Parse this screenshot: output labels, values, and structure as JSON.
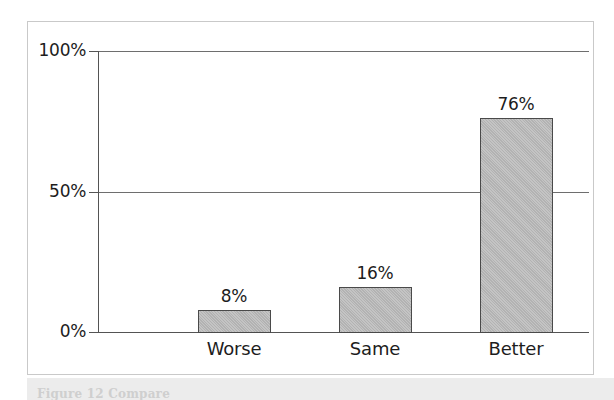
{
  "figure": {
    "background_color": "#ffffff",
    "frame_border_color": "#c9c9c9",
    "bar_fill_color": "#b9b9b9",
    "bar_edge_color": "#4a4a4a",
    "axis_color": "#545454",
    "text_color": "#1d1d1d",
    "caption_partial": "Figure 12 Compare"
  },
  "chart_data": {
    "type": "bar",
    "title": "",
    "xlabel": "",
    "ylabel": "",
    "categories": [
      "Worse",
      "Same",
      "Better"
    ],
    "values": [
      8,
      16,
      76
    ],
    "value_labels": [
      "8%",
      "16%",
      "76%"
    ],
    "ylim": [
      0,
      100
    ],
    "yticks": [
      0,
      50,
      100
    ],
    "ytick_labels": [
      "0%",
      "50%",
      "100%"
    ],
    "grid": true,
    "legend": false,
    "series": [
      {
        "name": "Response",
        "values": [
          8,
          16,
          76
        ]
      }
    ]
  }
}
